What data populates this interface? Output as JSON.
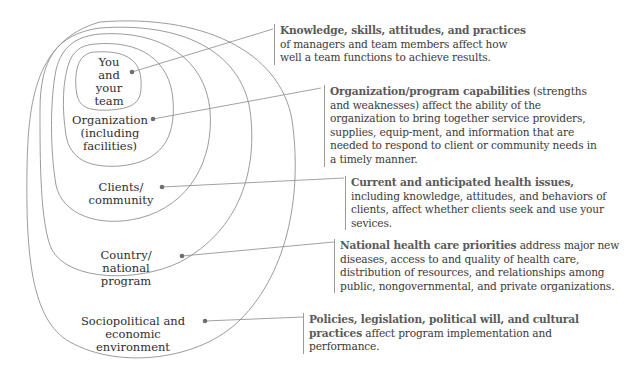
{
  "diagram": {
    "type": "nested-levels",
    "colors": {
      "outline": "#9c9c9c",
      "connector": "#8a8a8a",
      "dot": "#6e6e6e",
      "text": "#2e2e2e",
      "lead_text": "#5a5a5a"
    },
    "levels": [
      {
        "label_lines": [
          "You",
          "and",
          "your",
          "team"
        ],
        "description": {
          "lead": "Knowledge, skills, attitudes, and practices",
          "body": "of managers and team members affect how well a team functions to achieve results."
        }
      },
      {
        "label_lines": [
          "Organization",
          "(including",
          "facilities)"
        ],
        "description": {
          "lead": "Organization/program capabilities",
          "body": "(strengths and weaknesses) affect the ability of the organization to bring together service providers, supplies, equip-ment, and information that are needed to respond to client or community needs in a timely manner."
        }
      },
      {
        "label_lines": [
          "Clients/",
          "community"
        ],
        "description": {
          "lead": "Current and anticipated health issues,",
          "body": "including knowledge, attitudes, and behaviors of clients, affect whether clients seek and use your sevices."
        }
      },
      {
        "label_lines": [
          "Country/",
          "national program"
        ],
        "description": {
          "lead": "National health care priorities",
          "body": "address major new diseases, access to and quality of health care, distribution of resources, and relationships among public, nongovernmental, and private organizations."
        }
      },
      {
        "label_lines": [
          "Sociopolitical and",
          "economic environment"
        ],
        "description": {
          "lead": "Policies, legislation, political will, and cultural practices",
          "body": "affect program implementation and performance."
        }
      }
    ]
  }
}
